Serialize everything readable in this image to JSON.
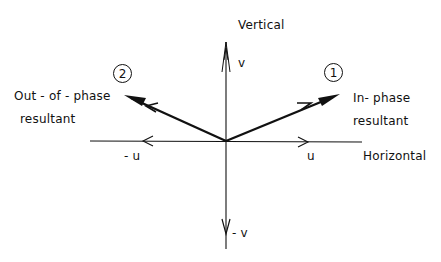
{
  "diagram": {
    "axes": {
      "vertical_title": "Vertical",
      "horizontal_title": "Horizontal",
      "pos_v": "v",
      "neg_v": "- v",
      "pos_u": "u",
      "neg_u": "- u"
    },
    "vectors": [
      {
        "number": "1",
        "label_line1": "In- phase",
        "label_line2": "resultant",
        "direction": "up-right"
      },
      {
        "number": "2",
        "label_line1": "Out - of - phase",
        "label_line2": "resultant",
        "direction": "up-left"
      }
    ],
    "colors": {
      "ink": "#111111",
      "background": "#ffffff"
    }
  }
}
